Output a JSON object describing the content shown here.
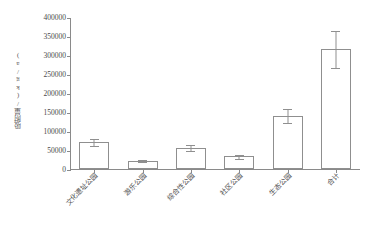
{
  "chart_data": {
    "type": "bar",
    "title": "",
    "xlabel": "",
    "ylabel": "吸附量/(kg/a)",
    "categories": [
      "文化遗址公园",
      "游乐公园",
      "综合性公园",
      "社区公园",
      "生态公园",
      "合计"
    ],
    "values": [
      70000,
      22000,
      55000,
      33000,
      140000,
      315000
    ],
    "errors_low": [
      61000,
      18000,
      47000,
      27000,
      122000,
      265000
    ],
    "errors_high": [
      81000,
      26000,
      67000,
      40000,
      160000,
      365000
    ],
    "ylim": [
      0,
      400000
    ],
    "ytick_values": [
      0,
      50000,
      100000,
      150000,
      200000,
      250000,
      300000,
      350000,
      400000
    ],
    "ytick_labels": [
      "0",
      "50000",
      "100000",
      "150000",
      "200000",
      "250000",
      "300000",
      "350000",
      "400000"
    ],
    "grid": false,
    "legend": "none",
    "bar_fill_color": "#ffffff",
    "bar_edge_color": "#8f8f8f",
    "axis_color": "#8a8a8a",
    "text_color": "#4a4a4a"
  }
}
